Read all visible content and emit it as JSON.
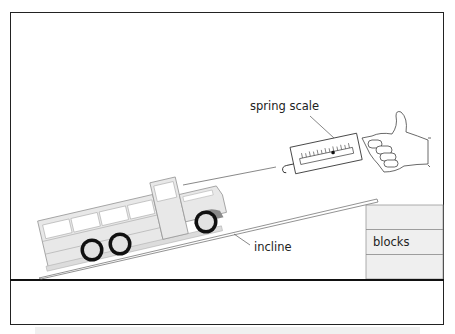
{
  "diagram": {
    "labels": {
      "spring_scale": "spring scale",
      "incline": "incline",
      "blocks": "blocks"
    },
    "colors": {
      "frame": "#222222",
      "truck_fill": "#e6e6e6",
      "truck_stroke": "#9a9a9a",
      "fender": "#8a8a8a",
      "wheel": "#111111",
      "hub": "#e2e2e2",
      "blocks_fill": "#efefef",
      "bottom_strip": "#f0f0f0"
    }
  }
}
